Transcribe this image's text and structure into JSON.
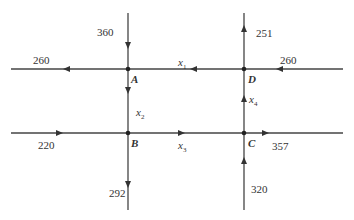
{
  "diagram": {
    "type": "traffic-flow-network",
    "line_color": "#444444",
    "nodes": {
      "A": {
        "label": "A"
      },
      "B": {
        "label": "B"
      },
      "C": {
        "label": "C"
      },
      "D": {
        "label": "D"
      }
    },
    "internal_edges": [
      {
        "name": "x1",
        "var": "x",
        "sub": "1",
        "from": "D",
        "to": "A"
      },
      {
        "name": "x2",
        "var": "x",
        "sub": "2",
        "from": "A",
        "to": "B"
      },
      {
        "name": "x3",
        "var": "x",
        "sub": "3",
        "from": "B",
        "to": "C"
      },
      {
        "name": "x4",
        "var": "x",
        "sub": "4",
        "from": "C",
        "to": "D"
      }
    ],
    "external_flows": {
      "A_in_top": "360",
      "A_out_left": "260",
      "D_out_top": "251",
      "D_in_right": "260",
      "B_in_left": "220",
      "B_out_bottom": "292",
      "C_out_right": "357",
      "C_in_bottom": "320"
    }
  }
}
